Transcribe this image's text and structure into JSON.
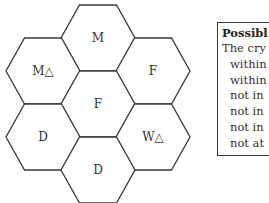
{
  "hexmap": {
    "cells": [
      {
        "id": "top",
        "label": "M",
        "cx": 98,
        "cy": 38
      },
      {
        "id": "upper-left",
        "label": "M△",
        "cx": 43,
        "cy": 71
      },
      {
        "id": "upper-right",
        "label": "F",
        "cx": 153,
        "cy": 71
      },
      {
        "id": "center",
        "label": "F",
        "cx": 98,
        "cy": 104
      },
      {
        "id": "lower-left",
        "label": "D",
        "cx": 43,
        "cy": 137
      },
      {
        "id": "lower-right",
        "label": "W△",
        "cx": 153,
        "cy": 137
      },
      {
        "id": "bottom",
        "label": "D",
        "cx": 98,
        "cy": 170
      }
    ],
    "stroke_color": "#3a3a3a"
  },
  "legend": {
    "title": "Possibl",
    "lines": [
      "The cry",
      "within",
      "within",
      "not in",
      "not in",
      "not in",
      "not at"
    ]
  }
}
